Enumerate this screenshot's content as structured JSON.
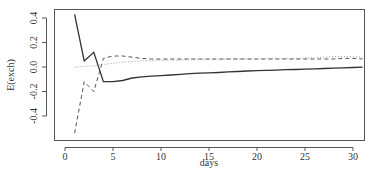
{
  "chart_data": {
    "type": "line",
    "title": "",
    "xlabel": "days",
    "ylabel": "E(exch)",
    "xlim": [
      -0.3,
      31.3
    ],
    "ylim": [
      -0.58,
      0.48
    ],
    "xticks": [
      0,
      5,
      10,
      15,
      20,
      25,
      30
    ],
    "yticks": [
      -0.4,
      -0.2,
      0.0,
      0.2,
      0.4
    ],
    "ytick_labels": [
      "-0.4",
      "-0.2",
      "0.0",
      "0.2",
      "0.4"
    ],
    "grid": false,
    "legend": null,
    "x": [
      1,
      2,
      3,
      4,
      5,
      6,
      7,
      8,
      9,
      10,
      11,
      12,
      13,
      14,
      15,
      16,
      17,
      18,
      19,
      20,
      21,
      22,
      23,
      24,
      25,
      26,
      27,
      28,
      29,
      30,
      31
    ],
    "series": [
      {
        "name": "solid",
        "style": "solid",
        "color": "#333333",
        "values": [
          0.43,
          0.05,
          0.12,
          -0.12,
          -0.12,
          -0.11,
          -0.09,
          -0.08,
          -0.075,
          -0.07,
          -0.065,
          -0.06,
          -0.055,
          -0.05,
          -0.048,
          -0.045,
          -0.04,
          -0.037,
          -0.033,
          -0.03,
          -0.027,
          -0.025,
          -0.022,
          -0.02,
          -0.017,
          -0.015,
          -0.012,
          -0.01,
          -0.007,
          -0.004,
          -0.002
        ]
      },
      {
        "name": "dashed",
        "style": "dashed",
        "color": "#555555",
        "values": [
          -0.54,
          -0.12,
          -0.2,
          0.07,
          0.09,
          0.09,
          0.08,
          0.07,
          0.065,
          0.065,
          0.065,
          0.065,
          0.065,
          0.065,
          0.065,
          0.065,
          0.065,
          0.065,
          0.065,
          0.065,
          0.065,
          0.065,
          0.065,
          0.065,
          0.065,
          0.065,
          0.065,
          0.065,
          0.07,
          0.07,
          0.065
        ]
      },
      {
        "name": "dotted",
        "style": "dotted",
        "color": "#999999",
        "values": [
          0.0,
          0.005,
          0.01,
          0.02,
          0.03,
          0.04,
          0.045,
          0.05,
          0.05,
          0.055,
          0.055,
          0.055,
          0.06,
          0.06,
          0.06,
          0.06,
          0.065,
          0.065,
          0.065,
          0.065,
          0.07,
          0.07,
          0.07,
          0.07,
          0.075,
          0.075,
          0.08,
          0.085,
          0.085,
          0.085,
          0.08
        ]
      }
    ]
  }
}
